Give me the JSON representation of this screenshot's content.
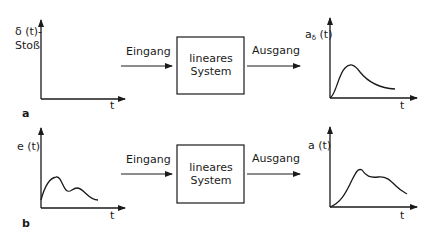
{
  "diagram": {
    "type": "block-diagram",
    "colors": {
      "stroke": "#1a1a1a",
      "background": "#ffffff"
    },
    "panels": [
      {
        "id": "a",
        "letter": "a",
        "input": {
          "ylabel_line1": "δ (t)-",
          "ylabel_line2": "Stoß",
          "xlabel": "t",
          "signal": "impulse (Dirac delta)"
        },
        "input_arrow_label": "Eingang",
        "system": {
          "line1": "lineares",
          "line2": "System"
        },
        "output_arrow_label": "Ausgang",
        "output": {
          "ylabel_main": "a",
          "ylabel_sub": "δ",
          "ylabel_rest": " (t)",
          "xlabel": "t",
          "signal": "impulse response (single hump, decaying)"
        }
      },
      {
        "id": "b",
        "letter": "b",
        "input": {
          "ylabel": "e (t)",
          "xlabel": "t",
          "signal": "arbitrary input (two humps)"
        },
        "input_arrow_label": "Eingang",
        "system": {
          "line1": "lineares",
          "line2": "System"
        },
        "output_arrow_label": "Ausgang",
        "output": {
          "ylabel": "a (t)",
          "xlabel": "t",
          "signal": "output response (smeared humps)"
        }
      }
    ]
  }
}
